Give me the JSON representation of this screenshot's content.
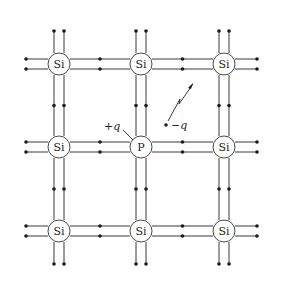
{
  "diagram": {
    "title": "",
    "atoms": [
      {
        "id": "a00",
        "label": "Si",
        "row": 0,
        "col": 0
      },
      {
        "id": "a01",
        "label": "Si",
        "row": 0,
        "col": 1
      },
      {
        "id": "a02",
        "label": "Si",
        "row": 0,
        "col": 2
      },
      {
        "id": "a10",
        "label": "Si",
        "row": 1,
        "col": 0
      },
      {
        "id": "a11",
        "label": "P",
        "row": 1,
        "col": 1
      },
      {
        "id": "a12",
        "label": "Si",
        "row": 1,
        "col": 2
      },
      {
        "id": "a20",
        "label": "Si",
        "row": 2,
        "col": 0
      },
      {
        "id": "a21",
        "label": "Si",
        "row": 2,
        "col": 1
      },
      {
        "id": "a22",
        "label": "Si",
        "row": 2,
        "col": 2
      }
    ],
    "labels": {
      "donor_charge": "+q",
      "free_electron_charge": "−q"
    },
    "colors": {
      "line": "#3a3a3a",
      "dot": "#1a1a1a",
      "atom_outline": "#4a4a4a"
    }
  }
}
